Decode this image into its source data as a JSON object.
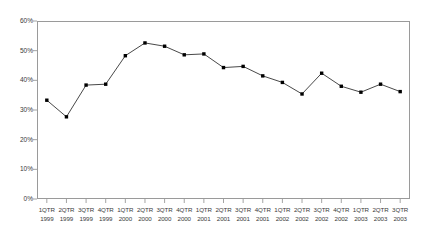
{
  "chart_data": {
    "type": "line",
    "title": "",
    "xlabel": "",
    "ylabel": "",
    "ylim": [
      0,
      60
    ],
    "ytick_labels": [
      "60%",
      "50%",
      "40%",
      "30%",
      "20%",
      "10%",
      "0%"
    ],
    "ytick_values": [
      60,
      50,
      40,
      30,
      20,
      10,
      0
    ],
    "grid": false,
    "legend": "none",
    "marker": "square",
    "marker_color": "#000000",
    "line_color": "#333333",
    "axis_color": "#9a9a9a",
    "categories": [
      "1QTR 1999",
      "2QTR 1999",
      "3QTR 1999",
      "4QTR 1999",
      "1QTR 2000",
      "2QTR 2000",
      "3QTR 2000",
      "4QTR 2000",
      "1QTR 2001",
      "2QTR 2001",
      "3QTR 2001",
      "4QTR 2001",
      "1QTR 2002",
      "2QTR 2002",
      "3QTR 2002",
      "4QTR 2002",
      "1QTR 2003",
      "2QTR 2003",
      "3QTR 2003"
    ],
    "category_lines": [
      [
        "1QTR",
        "1999"
      ],
      [
        "2QTR",
        "1999"
      ],
      [
        "3QTR",
        "1999"
      ],
      [
        "4QTR",
        "1999"
      ],
      [
        "1QTR",
        "2000"
      ],
      [
        "2QTR",
        "2000"
      ],
      [
        "3QTR",
        "2000"
      ],
      [
        "4QTR",
        "2000"
      ],
      [
        "1QTR",
        "2001"
      ],
      [
        "2QTR",
        "2001"
      ],
      [
        "3QTR",
        "2001"
      ],
      [
        "4QTR",
        "2001"
      ],
      [
        "1QTR",
        "2002"
      ],
      [
        "2QTR",
        "2002"
      ],
      [
        "3QTR",
        "2002"
      ],
      [
        "4QTR",
        "2002"
      ],
      [
        "1QTR",
        "2003"
      ],
      [
        "2QTR",
        "2003"
      ],
      [
        "3QTR",
        "2003"
      ]
    ],
    "values": [
      33.3,
      27.7,
      38.4,
      38.7,
      48.3,
      52.6,
      51.5,
      48.6,
      48.9,
      44.3,
      44.7,
      41.5,
      39.3,
      35.4,
      42.4,
      38.0,
      36.0,
      38.7,
      36.2
    ]
  }
}
